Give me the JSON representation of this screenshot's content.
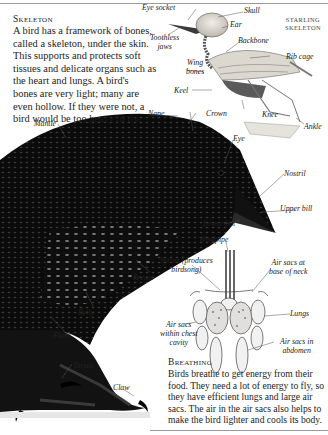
{
  "skeleton_section": {
    "heading": "Skeleton",
    "text_lines": [
      "A bird has a framework of bones,",
      "called a skeleton, under the skin.",
      "This supports and protects soft",
      "tissues and delicate organs such as",
      "the heart and lungs. A bird's",
      "bones are very light; many are",
      "even hollow. If they were not, a",
      "bird would be too heavy to fly."
    ]
  },
  "skeleton_diagram": {
    "title_lines": [
      "Starling",
      "skeleton"
    ],
    "labels": {
      "eye_socket": "Eye socket",
      "skull": "Skull",
      "ear": "Ear",
      "toothless_jaws_1": "Toothless",
      "toothless_jaws_2": "jaws",
      "backbone": "Backbone",
      "wing_bones_1": "Wing",
      "wing_bones_2": "bones",
      "rib_cage": "Rib cage",
      "keel": "Keel",
      "knee": "Knee",
      "ankle": "Ankle"
    }
  },
  "bird_labels": {
    "nape": "Nape",
    "mantle": "Mantle",
    "crown": "Crown",
    "eye": "Eye",
    "nostril": "Nostril",
    "upper_bill": "Upper bill",
    "lower_bill": "Lower bill",
    "breast": "Breast",
    "belly": "Belly",
    "flank": "Flank",
    "tarsus": "Tarsus",
    "claw": "Claw"
  },
  "respiratory_diagram": {
    "labels": {
      "windpipe": "Windpipe",
      "syrinx_1": "Syrinx (produces",
      "syrinx_2": "birdsong)",
      "air_sacs_neck_1": "Air sacs at",
      "air_sacs_neck_2": "base of neck",
      "lungs": "Lungs",
      "air_sacs_chest_1": "Air sacs",
      "air_sacs_chest_2": "within chest",
      "air_sacs_chest_3": "cavity",
      "air_sacs_abdomen_1": "Air sacs in",
      "air_sacs_abdomen_2": "abdomen"
    }
  },
  "breathing_section": {
    "heading": "Breathing",
    "text_lines": [
      "Birds breathe to get energy from their",
      "food. They need a lot of energy to fly, so",
      "they have efficient lungs and large air",
      "sacs. The air in the air sacs also helps to",
      "make the bird lighter and cools its body."
    ]
  },
  "colors": {
    "rule": "#9a9a9a",
    "text": "#1c1c1c",
    "bird_black": "#0b0b0b",
    "bone": "#e8e4dc"
  }
}
